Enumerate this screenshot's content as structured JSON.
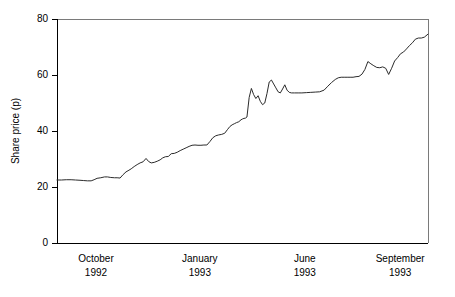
{
  "chart_data": {
    "type": "line",
    "title": "",
    "xlabel": "",
    "ylabel": "Share price (p)",
    "ylim": [
      0,
      80
    ],
    "yticks": [
      0,
      20,
      40,
      60,
      80
    ],
    "ytick_labels": [
      "0",
      "20",
      "40",
      "60",
      "80"
    ],
    "grid": false,
    "legend": false,
    "xtick_labels": [
      {
        "month": "October",
        "year": "1992",
        "pos": 0.105
      },
      {
        "month": "January",
        "year": "1993",
        "pos": 0.385
      },
      {
        "month": "June",
        "year": "1993",
        "pos": 0.668
      },
      {
        "month": "September",
        "year": "1993",
        "pos": 0.925
      }
    ],
    "series": [
      {
        "name": "Share price",
        "color": "#2b2b2b",
        "x": [
          0.0,
          0.012,
          0.025,
          0.038,
          0.05,
          0.062,
          0.072,
          0.082,
          0.092,
          0.1,
          0.108,
          0.118,
          0.128,
          0.136,
          0.145,
          0.155,
          0.162,
          0.17,
          0.178,
          0.186,
          0.194,
          0.2,
          0.208,
          0.216,
          0.224,
          0.232,
          0.24,
          0.247,
          0.254,
          0.262,
          0.27,
          0.278,
          0.285,
          0.292,
          0.3,
          0.308,
          0.316,
          0.324,
          0.332,
          0.34,
          0.348,
          0.356,
          0.364,
          0.372,
          0.38,
          0.388,
          0.396,
          0.404,
          0.412,
          0.42,
          0.428,
          0.436,
          0.444,
          0.452,
          0.46,
          0.466,
          0.472,
          0.478,
          0.484,
          0.49,
          0.496,
          0.5,
          0.504,
          0.508,
          0.512,
          0.518,
          0.524,
          0.53,
          0.536,
          0.542,
          0.548,
          0.554,
          0.56,
          0.566,
          0.572,
          0.578,
          0.584,
          0.59,
          0.596,
          0.602,
          0.608,
          0.614,
          0.62,
          0.626,
          0.632,
          0.64,
          0.65,
          0.66,
          0.672,
          0.684,
          0.696,
          0.708,
          0.72,
          0.73,
          0.74,
          0.75,
          0.758,
          0.766,
          0.774,
          0.782,
          0.79,
          0.798,
          0.806,
          0.814,
          0.822,
          0.83,
          0.838,
          0.846,
          0.854,
          0.862,
          0.87,
          0.878,
          0.886,
          0.894,
          0.902,
          0.91,
          0.918,
          0.926,
          0.934,
          0.942,
          0.95,
          0.958,
          0.966,
          0.974,
          0.982,
          0.99,
          1.0
        ],
        "y": [
          22.5,
          22.5,
          22.6,
          22.6,
          22.5,
          22.4,
          22.3,
          22.2,
          22.2,
          22.6,
          23.1,
          23.3,
          23.6,
          23.6,
          23.4,
          23.3,
          23.3,
          23.2,
          24.4,
          25.4,
          26.0,
          26.5,
          27.3,
          28.0,
          28.6,
          29.0,
          30.2,
          29.1,
          28.6,
          28.8,
          29.2,
          29.7,
          30.4,
          30.8,
          30.9,
          31.9,
          32.0,
          32.4,
          33.0,
          33.5,
          34.0,
          34.5,
          34.9,
          35.0,
          34.9,
          34.9,
          35.0,
          35.0,
          36.2,
          37.6,
          38.3,
          38.6,
          38.8,
          39.2,
          40.6,
          41.6,
          42.2,
          42.6,
          43.0,
          43.3,
          44.0,
          44.3,
          44.5,
          44.6,
          45.0,
          52.0,
          55.2,
          53.0,
          51.6,
          52.6,
          50.6,
          49.4,
          50.0,
          53.4,
          57.5,
          58.2,
          56.8,
          55.4,
          54.0,
          53.6,
          55.0,
          56.5,
          54.6,
          53.8,
          53.6,
          53.6,
          53.6,
          53.6,
          53.7,
          53.8,
          53.9,
          54.0,
          54.6,
          56.0,
          57.3,
          58.4,
          59.0,
          59.2,
          59.2,
          59.2,
          59.2,
          59.2,
          59.4,
          59.5,
          60.3,
          62.0,
          64.8,
          64.0,
          63.3,
          62.7,
          62.6,
          62.9,
          62.4,
          60.2,
          62.4,
          65.0,
          66.2,
          67.6,
          68.2,
          69.3,
          70.5,
          71.5,
          72.8,
          73.2,
          73.2,
          73.5,
          74.6
        ]
      }
    ]
  }
}
